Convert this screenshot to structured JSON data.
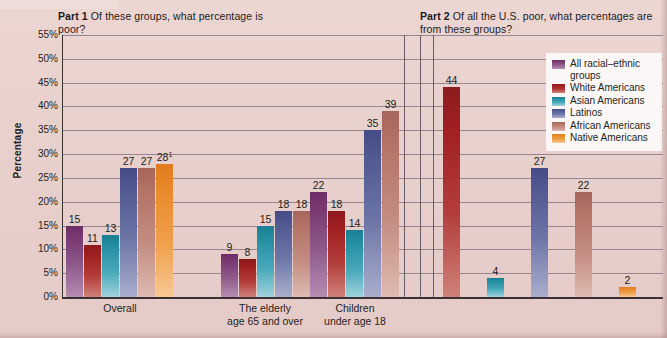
{
  "figure": {
    "part1_title_bold": "Part 1",
    "part1_title_rest": "Of these groups, what percentage is poor?",
    "part2_title_bold": "Part 2",
    "part2_title_rest": "Of all the U.S. poor, what percentages are from these groups?"
  },
  "chart_data": {
    "type": "bar",
    "xlabel": "",
    "ylabel": "Percentage",
    "ylim": [
      0,
      55
    ],
    "ytick_labels": [
      "0%",
      "5%",
      "10%",
      "15%",
      "20%",
      "25%",
      "30%",
      "35%",
      "40%",
      "45%",
      "50%",
      "55%"
    ],
    "ytick_values": [
      0,
      5,
      10,
      15,
      20,
      25,
      30,
      35,
      40,
      45,
      50,
      55
    ],
    "grid": true,
    "legend_position": "right",
    "series": [
      {
        "name": "All racial–ethnic groups",
        "color": "#7a3a72"
      },
      {
        "name": "White Americans",
        "color": "#a02022"
      },
      {
        "name": "Asian Americans",
        "color": "#2590a3"
      },
      {
        "name": "Latinos",
        "color": "#525b92"
      },
      {
        "name": "African Americans",
        "color": "#b57468"
      },
      {
        "name": "Native Americans",
        "color": "#e98a2c"
      }
    ],
    "panels": [
      {
        "name": "Part 1",
        "question": "Of these groups, what percentage is poor?",
        "categories": [
          "Overall",
          "The elderly age 65 and over",
          "Children under age 18"
        ],
        "groups": [
          {
            "category": "Overall",
            "category_line1": "Overall",
            "category_line2": "",
            "bars": [
              {
                "series": "All racial–ethnic groups",
                "value": 15,
                "label": "15"
              },
              {
                "series": "White Americans",
                "value": 11,
                "label": "11"
              },
              {
                "series": "Asian Americans",
                "value": 13,
                "label": "13"
              },
              {
                "series": "Latinos",
                "value": 27,
                "label": "27"
              },
              {
                "series": "African Americans",
                "value": 27,
                "label": "27"
              },
              {
                "series": "Native Americans",
                "value": 28,
                "label": "28",
                "footnote": "1"
              }
            ]
          },
          {
            "category": "The elderly age 65 and over",
            "category_line1": "The elderly",
            "category_line2": "age 65 and over",
            "bars": [
              {
                "series": "All racial–ethnic groups",
                "value": 9,
                "label": "9"
              },
              {
                "series": "White Americans",
                "value": 8,
                "label": "8"
              },
              {
                "series": "Asian Americans",
                "value": 15,
                "label": "15"
              },
              {
                "series": "Latinos",
                "value": 18,
                "label": "18"
              },
              {
                "series": "African Americans",
                "value": 18,
                "label": "18"
              }
            ]
          },
          {
            "category": "Children under age 18",
            "category_line1": "Children",
            "category_line2": "under age 18",
            "bars": [
              {
                "series": "All racial–ethnic groups",
                "value": 22,
                "label": "22"
              },
              {
                "series": "White Americans",
                "value": 18,
                "label": "18"
              },
              {
                "series": "Asian Americans",
                "value": 14,
                "label": "14"
              },
              {
                "series": "Latinos",
                "value": 35,
                "label": "35"
              },
              {
                "series": "African Americans",
                "value": 39,
                "label": "39"
              }
            ]
          }
        ]
      },
      {
        "name": "Part 2",
        "question": "Of all the U.S. poor, what percentages are from these groups?",
        "categories": [
          ""
        ],
        "groups": [
          {
            "category": "",
            "category_line1": "",
            "category_line2": "",
            "bars": [
              {
                "series": "White Americans",
                "value": 44,
                "label": "44"
              },
              {
                "series": "Asian Americans",
                "value": 4,
                "label": "4"
              },
              {
                "series": "Latinos",
                "value": 27,
                "label": "27"
              },
              {
                "series": "African Americans",
                "value": 22,
                "label": "22"
              },
              {
                "series": "Native Americans",
                "value": 2,
                "label": "2"
              }
            ]
          }
        ]
      }
    ]
  }
}
